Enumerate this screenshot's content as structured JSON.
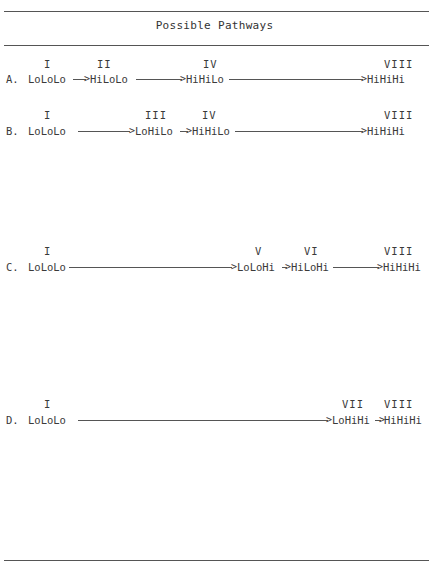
{
  "table": {
    "title": "Possible Pathways"
  },
  "pathways": [
    {
      "label": "A.",
      "stages": [
        {
          "numeral": "I",
          "state": "LoLoLo"
        },
        {
          "numeral": "II",
          "state": "HiLoLo"
        },
        {
          "numeral": "IV",
          "state": "HiHiLo"
        },
        {
          "numeral": "VIII",
          "state": "HiHiHi"
        }
      ]
    },
    {
      "label": "B.",
      "stages": [
        {
          "numeral": "I",
          "state": "LoLoLo"
        },
        {
          "numeral": "III",
          "state": "LoHiLo"
        },
        {
          "numeral": "IV",
          "state": "HiHiLo"
        },
        {
          "numeral": "VIII",
          "state": "HiHiHi"
        }
      ]
    },
    {
      "label": "C.",
      "stages": [
        {
          "numeral": "I",
          "state": "LoLoLo"
        },
        {
          "numeral": "V",
          "state": "LoLoHi"
        },
        {
          "numeral": "VI",
          "state": "HiLoHi"
        },
        {
          "numeral": "VIII",
          "state": "HiHiHi"
        }
      ]
    },
    {
      "label": "D.",
      "stages": [
        {
          "numeral": "I",
          "state": "LoLoLo"
        },
        {
          "numeral": "VII",
          "state": "LoHiHi"
        },
        {
          "numeral": "VIII",
          "state": "HiHiHi"
        }
      ]
    }
  ],
  "glyphs": {
    "arrowhead": ">"
  }
}
